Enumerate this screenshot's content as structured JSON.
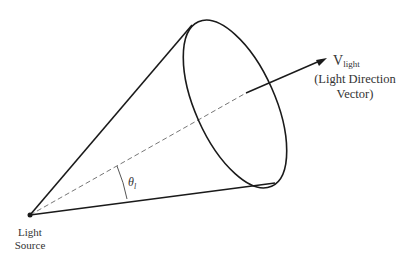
{
  "diagram": {
    "labels": {
      "vector_main": "V",
      "vector_sub": "light",
      "vector_desc_line1": "(Light Direction",
      "vector_desc_line2": "Vector)",
      "angle_symbol": "θ",
      "angle_sub": "l",
      "source_line1": "Light",
      "source_line2": "Source"
    },
    "colors": {
      "stroke": "#1a1a1a",
      "dashed": "#777777",
      "text": "#333333"
    }
  }
}
